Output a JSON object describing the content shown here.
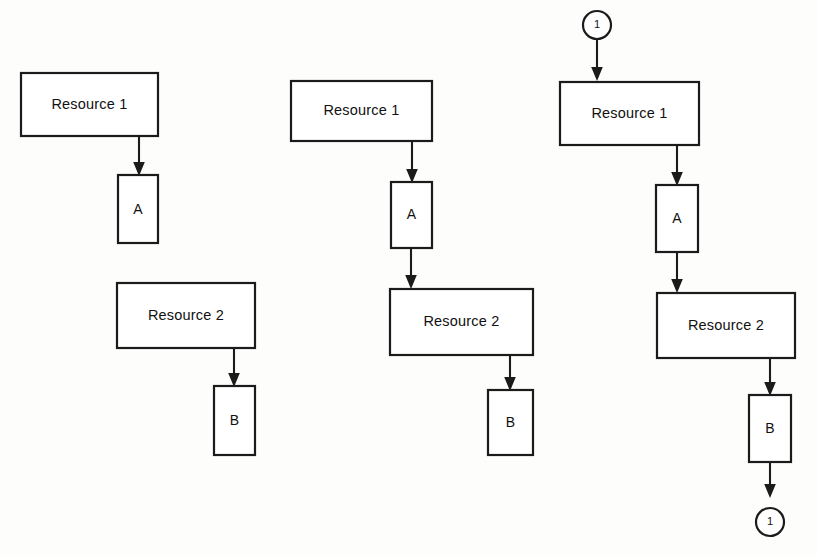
{
  "page": {
    "background_color": "#fdfdfc",
    "line_color": "#1b1b1b",
    "box_fill": "#ffffff",
    "width": 817,
    "height": 556
  },
  "panels": [
    {
      "id": "panel-1",
      "name": "stage-one",
      "nodes": {
        "resource1": {
          "label": "Resource 1",
          "shape": "rectangle"
        },
        "processA": {
          "label": "A",
          "shape": "rectangle"
        },
        "resource2": {
          "label": "Resource 2",
          "shape": "rectangle"
        },
        "processB": {
          "label": "B",
          "shape": "rectangle"
        }
      },
      "edges": [
        {
          "from": "Resource 1",
          "to": "A",
          "style": "arrow"
        },
        {
          "from": "Resource 2",
          "to": "B",
          "style": "arrow"
        }
      ]
    },
    {
      "id": "panel-2",
      "name": "stage-two",
      "nodes": {
        "resource1": {
          "label": "Resource 1",
          "shape": "rectangle"
        },
        "processA": {
          "label": "A",
          "shape": "rectangle"
        },
        "resource2": {
          "label": "Resource 2",
          "shape": "rectangle"
        },
        "processB": {
          "label": "B",
          "shape": "rectangle"
        }
      },
      "edges": [
        {
          "from": "Resource 1",
          "to": "A",
          "style": "arrow"
        },
        {
          "from": "A",
          "to": "Resource 2",
          "style": "arrow"
        },
        {
          "from": "Resource 2",
          "to": "B",
          "style": "arrow"
        }
      ]
    },
    {
      "id": "panel-3",
      "name": "stage-three",
      "nodes": {
        "connector_in": {
          "label": "1",
          "shape": "circle"
        },
        "resource1": {
          "label": "Resource 1",
          "shape": "rectangle"
        },
        "processA": {
          "label": "A",
          "shape": "rectangle"
        },
        "resource2": {
          "label": "Resource 2",
          "shape": "rectangle"
        },
        "processB": {
          "label": "B",
          "shape": "rectangle"
        },
        "connector_out": {
          "label": "1",
          "shape": "circle"
        }
      },
      "edges": [
        {
          "from": "1",
          "to": "Resource 1",
          "style": "arrow"
        },
        {
          "from": "Resource 1",
          "to": "A",
          "style": "arrow"
        },
        {
          "from": "A",
          "to": "Resource 2",
          "style": "arrow"
        },
        {
          "from": "Resource 2",
          "to": "B",
          "style": "arrow"
        },
        {
          "from": "B",
          "to": "1",
          "style": "arrow"
        }
      ]
    }
  ],
  "labels": {
    "resource_one": "Resource 1",
    "resource_two": "Resource 2",
    "process_a": "A",
    "process_b": "B",
    "connector_one": "1"
  }
}
